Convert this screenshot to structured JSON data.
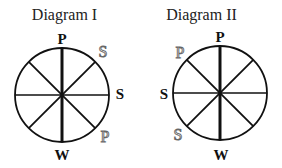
{
  "diagrams": [
    {
      "title": "Diagram I",
      "labels": {
        "top": "P",
        "upper_right": "S",
        "right": "S",
        "lower_right": "P",
        "bottom": "W"
      },
      "label_styles": {
        "top": "bold",
        "upper_right": "outline",
        "right": "bold",
        "lower_right": "outline",
        "bottom": "bold"
      }
    },
    {
      "title": "Diagram II",
      "labels": {
        "top": "P",
        "upper_left": "P",
        "left": "S",
        "lower_left": "S",
        "bottom": "W"
      },
      "label_styles": {
        "top": "bold",
        "upper_left": "outline",
        "left": "bold",
        "lower_left": "outline",
        "bottom": "bold"
      }
    }
  ],
  "colors": {
    "stroke": "#111111",
    "outline_letter": "#666666"
  }
}
